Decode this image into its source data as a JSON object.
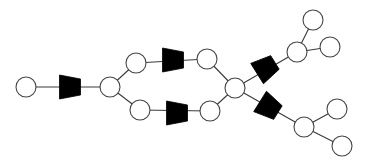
{
  "diagram": {
    "width": 366,
    "height": 166,
    "background": "#ffffff",
    "colors": {
      "node_fill": "#ffffff",
      "node_stroke": "#444444",
      "edge": "#3a3a3a",
      "trapezoid_fill": "#000000"
    },
    "node_radius": 10,
    "nodes": [
      {
        "id": "A",
        "x": 26,
        "y": 87
      },
      {
        "id": "B",
        "x": 110,
        "y": 87
      },
      {
        "id": "C",
        "x": 136,
        "y": 63
      },
      {
        "id": "D",
        "x": 207,
        "y": 59
      },
      {
        "id": "E",
        "x": 140,
        "y": 110
      },
      {
        "id": "F",
        "x": 210,
        "y": 111
      },
      {
        "id": "G",
        "x": 235,
        "y": 88
      },
      {
        "id": "H",
        "x": 297,
        "y": 52
      },
      {
        "id": "I",
        "x": 313,
        "y": 20
      },
      {
        "id": "J",
        "x": 330,
        "y": 47
      },
      {
        "id": "K",
        "x": 304,
        "y": 127
      },
      {
        "id": "L",
        "x": 337,
        "y": 109
      },
      {
        "id": "M",
        "x": 342,
        "y": 146
      }
    ],
    "edges": [
      [
        "A",
        "B"
      ],
      [
        "B",
        "C"
      ],
      [
        "B",
        "E"
      ],
      [
        "C",
        "D"
      ],
      [
        "E",
        "F"
      ],
      [
        "D",
        "G"
      ],
      [
        "F",
        "G"
      ],
      [
        "G",
        "H"
      ],
      [
        "G",
        "K"
      ],
      [
        "H",
        "I"
      ],
      [
        "H",
        "J"
      ],
      [
        "K",
        "L"
      ],
      [
        "K",
        "M"
      ]
    ],
    "trapezoids": [
      {
        "id": "T1",
        "on_edge": [
          "A",
          "B"
        ],
        "cx": 70,
        "cy": 87,
        "angle": 0
      },
      {
        "id": "T2",
        "on_edge": [
          "C",
          "D"
        ],
        "cx": 173,
        "cy": 60,
        "angle": 0
      },
      {
        "id": "T3",
        "on_edge": [
          "E",
          "F"
        ],
        "cx": 177,
        "cy": 113,
        "angle": 0
      },
      {
        "id": "T4",
        "on_edge": [
          "G",
          "H"
        ],
        "cx": 266,
        "cy": 68,
        "angle": -32
      },
      {
        "id": "T5",
        "on_edge": [
          "G",
          "K"
        ],
        "cx": 269,
        "cy": 107,
        "angle": 32
      }
    ]
  }
}
